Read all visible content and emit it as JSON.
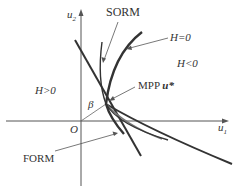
{
  "diagram": {
    "axes": {
      "x_label": "u",
      "x_sub": "1",
      "y_label": "u",
      "y_sub": "2",
      "origin_label": "O"
    },
    "labels": {
      "sorm": "SORM",
      "form": "FORM",
      "limit_state": "H=0",
      "failure_region": "H<0",
      "safe_region": "H>0",
      "mpp": "MPP ",
      "mpp_symbol": "u*",
      "beta": "β"
    },
    "colors": {
      "curve_dark": "#333333",
      "curve_gray": "#777777",
      "axis": "#555555",
      "text": "#333333"
    }
  }
}
